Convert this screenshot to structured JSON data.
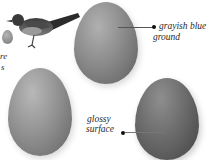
{
  "illustration": {
    "subject": "bird and eggs",
    "bird": {
      "icon": "bird-illustration"
    },
    "eggs": [
      {
        "name": "egg-top-center",
        "color": "#8a8a8a"
      },
      {
        "name": "egg-bottom-left",
        "color": "#8f8f8f"
      },
      {
        "name": "egg-bottom-right",
        "color": "#6e6e6e"
      },
      {
        "name": "egg-small-left",
        "color": "#9a9a9a"
      }
    ],
    "labels": {
      "ground_line1": "grayish blue",
      "ground_line2": "ground",
      "surface_line1": "glossy",
      "surface_line2": "surface"
    },
    "left_fragments": {
      "frag1": "re",
      "frag2": "s"
    }
  }
}
